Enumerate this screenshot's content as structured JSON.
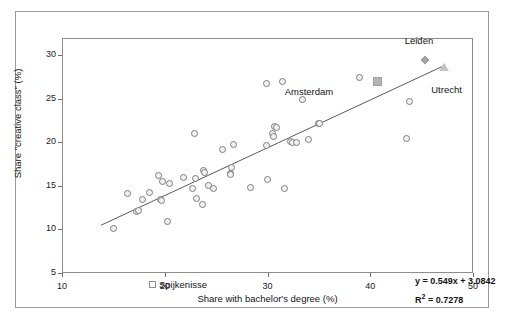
{
  "chart_data": {
    "type": "scatter",
    "title": "",
    "xlabel": "Share with bachelor's degree (%)",
    "ylabel": "Share \"creative class\" (%)",
    "xlim": [
      10,
      50
    ],
    "ylim": [
      5,
      32
    ],
    "xticks": [
      10,
      20,
      30,
      40,
      50
    ],
    "yticks": [
      5,
      10,
      15,
      20,
      25,
      30
    ],
    "grid": false,
    "legend_position": "inside-bottom-left",
    "trendline": {
      "equation": "y = 0.549x + 3.0842",
      "r_squared_label": "R",
      "r_squared_exponent": "2",
      "r_squared_value": "= 0.7278",
      "slope": 0.549,
      "intercept": 3.0842,
      "r2": 0.7278,
      "x_start": 13.7,
      "x_end": 47.2
    },
    "legend": [
      {
        "label": "Spijkenisse",
        "marker": "square-open"
      }
    ],
    "annotations": [
      {
        "text": "Leiden",
        "x": 45.2,
        "y": 31.0
      },
      {
        "text": "Utrecht",
        "x": 47.2,
        "y": 27.3
      },
      {
        "text": "Amsterdam",
        "x": 38.0,
        "y": 26.2
      }
    ],
    "series": [
      {
        "name": "Dutch municipalities",
        "marker": "circle-open",
        "points": [
          {
            "x": 14.9,
            "y": 10.2
          },
          {
            "x": 16.3,
            "y": 14.3
          },
          {
            "x": 17.2,
            "y": 12.2
          },
          {
            "x": 17.3,
            "y": 12.3
          },
          {
            "x": 17.7,
            "y": 13.6
          },
          {
            "x": 18.4,
            "y": 14.4
          },
          {
            "x": 19.3,
            "y": 16.3
          },
          {
            "x": 19.5,
            "y": 13.6
          },
          {
            "x": 19.6,
            "y": 13.5
          },
          {
            "x": 19.7,
            "y": 15.6
          },
          {
            "x": 20.2,
            "y": 11.0
          },
          {
            "x": 20.4,
            "y": 15.4
          },
          {
            "x": 21.7,
            "y": 16.1
          },
          {
            "x": 22.6,
            "y": 14.8
          },
          {
            "x": 22.8,
            "y": 21.1
          },
          {
            "x": 22.9,
            "y": 16.0
          },
          {
            "x": 23.0,
            "y": 13.7
          },
          {
            "x": 23.6,
            "y": 13.0
          },
          {
            "x": 23.7,
            "y": 16.9
          },
          {
            "x": 23.8,
            "y": 16.7
          },
          {
            "x": 24.2,
            "y": 15.2
          },
          {
            "x": 24.6,
            "y": 14.8
          },
          {
            "x": 25.5,
            "y": 19.3
          },
          {
            "x": 26.3,
            "y": 16.6
          },
          {
            "x": 26.3,
            "y": 16.4
          },
          {
            "x": 26.4,
            "y": 17.2
          },
          {
            "x": 26.6,
            "y": 19.9
          },
          {
            "x": 28.2,
            "y": 14.9
          },
          {
            "x": 29.8,
            "y": 19.8
          },
          {
            "x": 29.8,
            "y": 26.9
          },
          {
            "x": 29.9,
            "y": 15.9
          },
          {
            "x": 30.4,
            "y": 21.2
          },
          {
            "x": 30.5,
            "y": 20.8
          },
          {
            "x": 30.6,
            "y": 21.9
          },
          {
            "x": 30.8,
            "y": 21.8
          },
          {
            "x": 31.4,
            "y": 27.1
          },
          {
            "x": 31.6,
            "y": 14.8
          },
          {
            "x": 32.1,
            "y": 20.2
          },
          {
            "x": 32.3,
            "y": 20.1
          },
          {
            "x": 32.7,
            "y": 20.1
          },
          {
            "x": 33.3,
            "y": 25.1
          },
          {
            "x": 33.9,
            "y": 20.5
          },
          {
            "x": 34.9,
            "y": 22.3
          },
          {
            "x": 35.0,
            "y": 22.3
          },
          {
            "x": 38.9,
            "y": 27.6
          },
          {
            "x": 43.4,
            "y": 20.6
          },
          {
            "x": 43.7,
            "y": 24.8
          }
        ]
      },
      {
        "name": "Amsterdam",
        "marker": "square-filled",
        "points": [
          {
            "x": 40.6,
            "y": 27.1
          }
        ]
      },
      {
        "name": "Leiden",
        "marker": "diamond-filled",
        "points": [
          {
            "x": 45.2,
            "y": 29.6
          }
        ]
      },
      {
        "name": "Utrecht",
        "marker": "triangle-open",
        "points": [
          {
            "x": 47.1,
            "y": 28.8
          }
        ]
      }
    ]
  }
}
